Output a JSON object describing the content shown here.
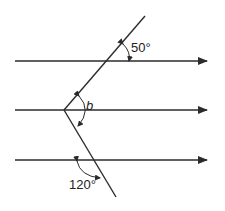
{
  "diagram": {
    "title": "",
    "type": "parallel lines cut by bent transversal",
    "colors": {
      "stroke": "#2b2b2b",
      "background": "#ffffff"
    },
    "parallel_lines": [
      {
        "id": "line-top",
        "y": 61,
        "x1": 15,
        "x2": 207,
        "arrow": "right"
      },
      {
        "id": "line-middle",
        "y": 110,
        "x1": 15,
        "x2": 207,
        "arrow": "right"
      },
      {
        "id": "line-bottom",
        "y": 160,
        "x1": 15,
        "x2": 207,
        "arrow": "right"
      }
    ],
    "transversal": {
      "vertex": [
        64,
        110
      ],
      "upper_end": [
        145,
        16
      ],
      "lower_end": [
        116,
        197
      ]
    },
    "angles": [
      {
        "id": "angle-50",
        "label": "50°",
        "position": "between upper transversal and top line, right side"
      },
      {
        "id": "angle-b",
        "label": "b",
        "position": "at vertex, between upper and lower segments (reflex-facing right)"
      },
      {
        "id": "angle-120",
        "label": "120°",
        "position": "between bottom line and lower transversal, left-below"
      }
    ]
  }
}
